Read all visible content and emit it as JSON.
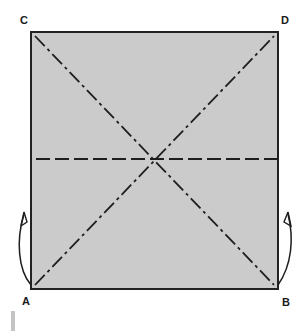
{
  "diagram": {
    "type": "origami-fold-diagram",
    "paper": {
      "fill_color": "#cbcbcb",
      "border_color": "#222222",
      "shape": "square"
    },
    "corners": {
      "top_left": "C",
      "top_right": "D",
      "bottom_left": "A",
      "bottom_right": "B"
    },
    "fold_lines": [
      {
        "name": "diagonal-A-D",
        "style": "dash-dot",
        "from": "A",
        "to": "D"
      },
      {
        "name": "diagonal-C-B",
        "style": "dash-dot",
        "from": "C",
        "to": "B"
      },
      {
        "name": "horizontal-center",
        "style": "dashed",
        "orientation": "horizontal"
      }
    ],
    "arrows": [
      {
        "name": "fold-arrow-left",
        "side": "left",
        "direction": "up"
      },
      {
        "name": "fold-arrow-right",
        "side": "right",
        "direction": "up"
      }
    ],
    "line_color": "#1e1e1e"
  }
}
